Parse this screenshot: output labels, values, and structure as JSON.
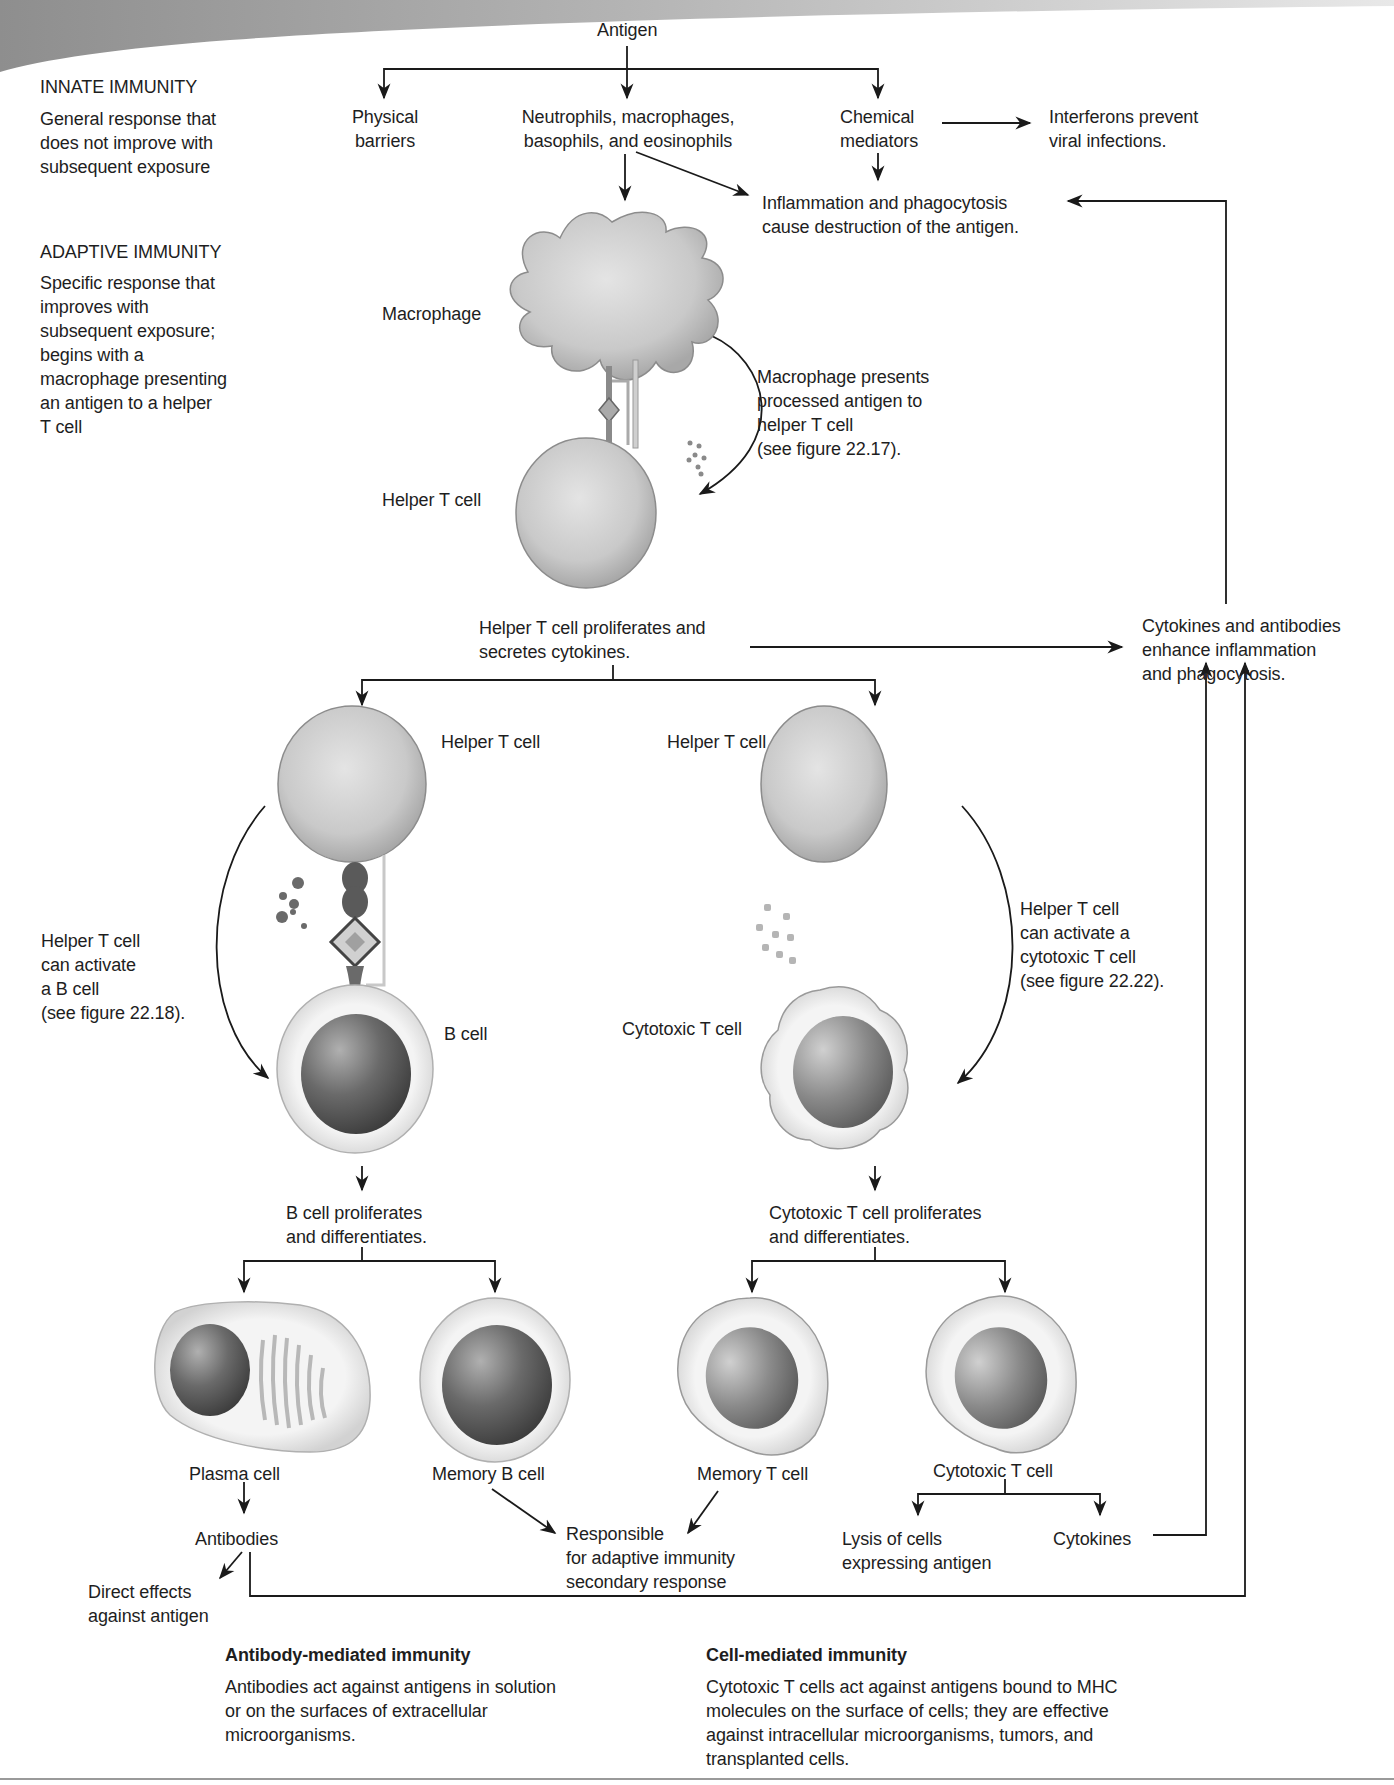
{
  "top": {
    "antigen": "Antigen"
  },
  "left_panel": {
    "innate_title": "INNATE IMMUNITY",
    "innate_desc": "General response that\ndoes not improve with\nsubsequent exposure",
    "adaptive_title": "ADAPTIVE IMMUNITY",
    "adaptive_desc": "Specific response that\nimproves with\nsubsequent exposure;\nbegins with a\nmacrophage presenting\nan antigen to a helper\nT cell"
  },
  "innate": {
    "physical_barriers": "Physical\nbarriers",
    "phagocytes": "Neutrophils, macrophages,\nbasophils, and eosinophils",
    "chemical_mediators": "Chemical\nmediators",
    "interferons": "Interferons prevent\nviral infections.",
    "inflammation": "Inflammation and phagocytosis\ncause destruction of the antigen."
  },
  "presentation": {
    "macrophage_label": "Macrophage",
    "helper_t_label": "Helper T cell",
    "presents_note": "Macrophage presents\nprocessed antigen to\nhelper T cell\n(see figure 22.17).",
    "proliferates": "Helper T cell proliferates and\nsecretes cytokines.",
    "cytokines_enhance": "Cytokines and antibodies\nenhance inflammation\nand phagocytosis."
  },
  "b_branch": {
    "helper_t_label": "Helper T cell",
    "activate_note": "Helper T cell\ncan activate\na B cell\n(see figure 22.18).",
    "b_cell_label": "B cell",
    "proliferates": "B cell proliferates\nand differentiates.",
    "plasma_cell": "Plasma cell",
    "memory_b_cell": "Memory B cell",
    "antibodies": "Antibodies",
    "direct_effects": "Direct effects\nagainst antigen"
  },
  "t_branch": {
    "helper_t_label": "Helper T cell",
    "activate_note": "Helper T cell\ncan activate a\ncytotoxic T cell\n(see figure 22.22).",
    "cytotoxic_label": "Cytotoxic T cell",
    "proliferates": "Cytotoxic T cell proliferates\nand differentiates.",
    "memory_t_cell": "Memory T cell",
    "cytotoxic_t_cell": "Cytotoxic T cell",
    "lysis": "Lysis of cells\nexpressing antigen",
    "cytokines": "Cytokines"
  },
  "shared": {
    "responsible": "Responsible\nfor adaptive immunity\nsecondary response"
  },
  "footer": {
    "antibody_title": "Antibody-mediated immunity",
    "antibody_desc": "Antibodies act against antigens in solution\nor on the surfaces of extracellular\nmicroorganisms.",
    "cell_title": "Cell-mediated immunity",
    "cell_desc": "Cytotoxic T cells act against antigens bound to MHC\nmolecules on the surface of cells; they are effective\nagainst intracellular microorganisms, tumors, and\ntransplanted cells."
  },
  "colors": {
    "line": "#1a1a1a",
    "banner_dark": "#8f8f8f",
    "banner_light": "#d8d8d8",
    "cell_membrane": "#d6d6d6",
    "nucleus": "#5a5a5a"
  }
}
